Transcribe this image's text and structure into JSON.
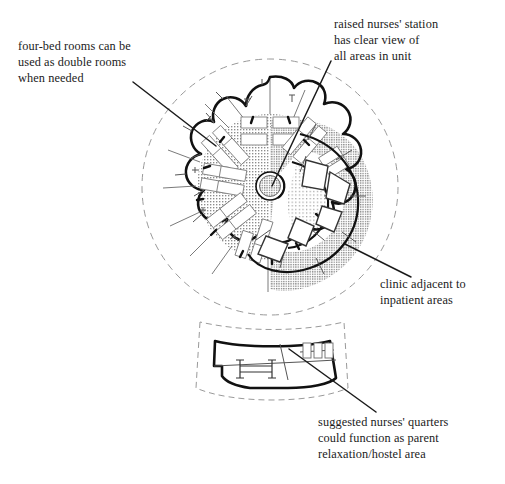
{
  "figure": {
    "type": "architectural-floor-plan",
    "background_color": "#ffffff",
    "ink_color": "#1b1b1b",
    "wall_color": "#111111",
    "partition_color": "#6b6b6b",
    "site_boundary_color": "#9a9a9a",
    "stipple_color": "#8c8c8c"
  },
  "callouts": [
    {
      "id": "four-bed",
      "lines": [
        "four-bed rooms can be",
        "used as double rooms",
        "when needed"
      ],
      "text": "four-bed rooms can be\nused as double rooms\nwhen needed",
      "leader": {
        "x1": 133,
        "y1": 82,
        "x2": 216,
        "y2": 146
      }
    },
    {
      "id": "nurses-station",
      "lines": [
        "raised nurses' station",
        "has clear view of",
        "all areas in unit"
      ],
      "text": "raised nurses' station\nhas clear view of\nall areas in unit",
      "leader": {
        "x1": 331,
        "y1": 61,
        "x2": 272,
        "y2": 186
      }
    },
    {
      "id": "clinic",
      "lines": [
        "clinic adjacent to",
        "inpatient areas"
      ],
      "text": "clinic adjacent to\ninpatient areas",
      "leader": {
        "x1": 345,
        "y1": 244,
        "x2": 411,
        "y2": 277
      }
    },
    {
      "id": "nurses-quarters",
      "lines": [
        "suggested nurses' quarters",
        "could function as parent",
        "relaxation/hostel area"
      ],
      "text": "suggested nurses' quarters\ncould function as parent\nrelaxation/hostel area",
      "leader": {
        "x1": 289,
        "y1": 349,
        "x2": 376,
        "y2": 412
      }
    }
  ],
  "plan": {
    "main_building": {
      "center_x": 270,
      "center_y": 187,
      "scallop_radius": 110,
      "lobe_count": 9,
      "site_boundary_radius": 128
    },
    "nurses_station": {
      "center_x": 270,
      "center_y": 186,
      "radius": 13,
      "label": "raised nurses station"
    },
    "core_circulation": {
      "radius": 72,
      "fill": "stipple"
    },
    "bed_wing_count": 5,
    "beds_per_wing": 4,
    "clinic_zone": {
      "side": "right",
      "organization": "spiral"
    },
    "pavilion": {
      "label": "nurses quarters",
      "center_x": 272,
      "center_y": 368
    }
  }
}
